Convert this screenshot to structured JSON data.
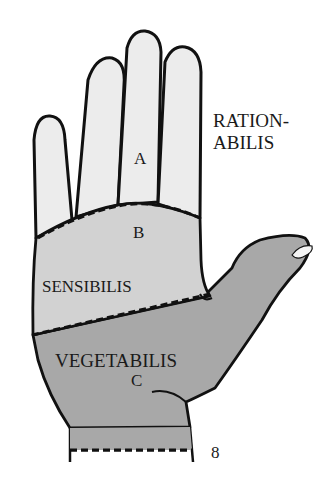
{
  "diagram": {
    "title_label": {
      "line1": "RATION-",
      "line2": "ABILIS"
    },
    "zones": [
      {
        "id": "A",
        "letter": "A",
        "name": "RATIONABILIS",
        "color": "#ececec"
      },
      {
        "id": "B",
        "letter": "B",
        "name": "SENSIBILIS",
        "color": "#d2d2d2"
      },
      {
        "id": "C",
        "letter": "C",
        "name": "VEGETABILIS",
        "color": "#a8a8a8"
      }
    ],
    "labels": {
      "sensibilis": "SENSIBILIS",
      "vegetabilis": "VEGETABILIS",
      "a": "A",
      "b": "B",
      "c": "C",
      "page_number": "8"
    },
    "colors": {
      "outline": "#111111",
      "zone_a": "#ececec",
      "zone_b": "#d2d2d2",
      "zone_c": "#a8a8a8",
      "background": "#ffffff"
    }
  }
}
